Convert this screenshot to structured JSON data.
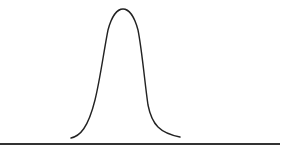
{
  "diagram": {
    "type": "bell-curve",
    "stroke_color": "#222222",
    "baseline_color": "#333333",
    "background": "#ffffff",
    "curve": {
      "start": [
        71,
        138
      ],
      "peak": [
        123,
        9
      ],
      "end": [
        180,
        137
      ]
    },
    "baseline": {
      "x1": 0,
      "x2": 280,
      "y": 144
    }
  }
}
